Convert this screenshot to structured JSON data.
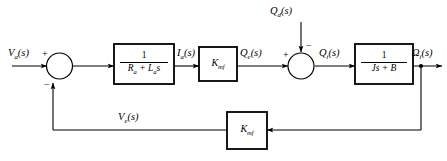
{
  "diagram": {
    "type": "control-system-block-diagram",
    "background_color": "#ffffff",
    "line_color": "#000000",
    "signals": {
      "input": "V",
      "input_sub": "a",
      "input_arg": "(s)",
      "current": "I",
      "current_sub": "a",
      "current_arg": "(s)",
      "torque_developed": "Q",
      "torque_developed_sub": "e",
      "torque_developed_arg": "(s)",
      "disturbance": "Q",
      "disturbance_sub": "d",
      "disturbance_arg": "(s)",
      "torque_net": "Q",
      "torque_net_sub": "t",
      "torque_net_arg": "(s)",
      "output": "Ω",
      "output_sub": "i",
      "output_arg": "(s)",
      "back_emf": "V",
      "back_emf_sub": "e",
      "back_emf_arg": "(s)"
    },
    "blocks": [
      {
        "id": "armature-circuit",
        "kind": "fraction",
        "numerator": "1",
        "denominator": "R",
        "denominator_sub": "a",
        "denominator_rest": " + L",
        "denominator_sub2": "a",
        "denominator_rest2": "s"
      },
      {
        "id": "torque-constant",
        "kind": "gain",
        "gain": "K",
        "gain_sub": "mf"
      },
      {
        "id": "mechanical-load",
        "kind": "fraction",
        "numerator": "1",
        "denominator": "Js + B"
      },
      {
        "id": "back-emf-constant",
        "kind": "gain",
        "gain": "K",
        "gain_sub": "mf"
      }
    ],
    "summing_junctions": [
      {
        "id": "input-summer",
        "sign_left": "+",
        "sign_bottom": "−"
      },
      {
        "id": "torque-summer",
        "sign_left": "+",
        "sign_top": "−"
      }
    ]
  }
}
